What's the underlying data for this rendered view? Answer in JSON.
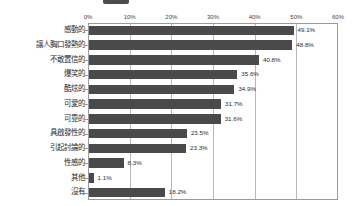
{
  "header": {
    "badge_label": "",
    "title": "",
    "visible": true
  },
  "chart_data": {
    "type": "bar",
    "orientation": "horizontal",
    "title": "",
    "xlabel": "",
    "ylabel": "",
    "xlim": [
      0,
      60
    ],
    "xticks": [
      "0%",
      "10%",
      "20%",
      "30%",
      "40%",
      "50%",
      "60%"
    ],
    "xtick_values": [
      0,
      10,
      20,
      30,
      40,
      50,
      60
    ],
    "grid": true,
    "grid_axis": "x",
    "legend": false,
    "bar_color": "#4a4a4a",
    "axis_color": "#9a9a9a",
    "gridline_color": "#b8b8b8",
    "categories": [
      "感動的",
      "讓人胸口發熱的",
      "不敢置信的",
      "爆笑的",
      "酷炫的",
      "可愛的",
      "可靠的",
      "具啟發性的",
      "引起討論的",
      "性感的",
      "其他",
      "沒有"
    ],
    "values": [
      49.1,
      48.8,
      40.8,
      35.6,
      34.9,
      31.7,
      31.6,
      23.5,
      23.3,
      8.3,
      1.1,
      18.2
    ],
    "value_labels": [
      "49.1%",
      "48.8%",
      "40.8%",
      "35.6%",
      "34.9%",
      "31.7%",
      "31.6%",
      "23.5%",
      "23.3%",
      "8.3%",
      "1.1%",
      "18.2%"
    ]
  }
}
